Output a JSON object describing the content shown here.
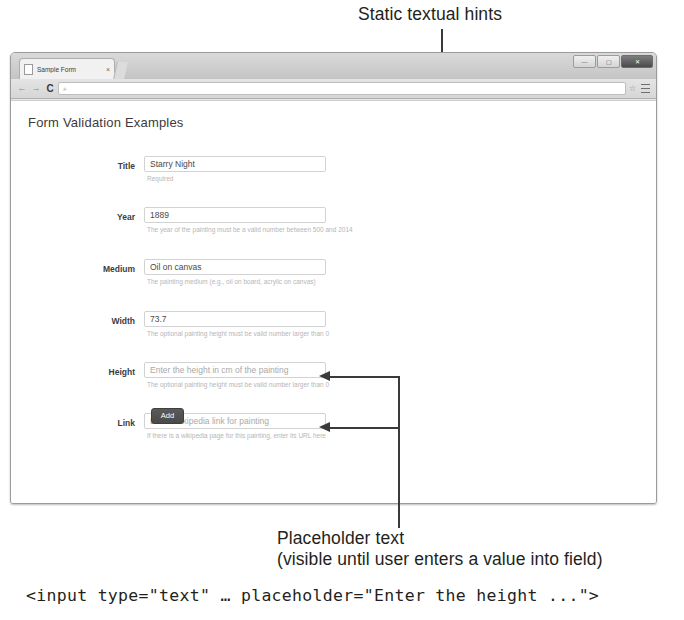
{
  "annotations": {
    "top_callout": "Static textual hints",
    "bottom_callout_line1": "Placeholder text",
    "bottom_callout_line2": "(visible until user enters a value into field)",
    "code_snippet": "<input type=\"text\" … placeholder=\"Enter the height ...\">"
  },
  "browser": {
    "tab": {
      "title": "Sample Form",
      "close_label": "×",
      "favicon_name": "page-icon"
    },
    "window_controls": {
      "minimize": "—",
      "maximize": "▢",
      "close": "✕"
    },
    "toolbar": {
      "back": "←",
      "forward": "→",
      "reload": "C",
      "omnibox_value": "",
      "omnibox_placeholder": "",
      "search_icon": "⌕",
      "bookmark_star": "☆",
      "menu_icon": "menu-icon"
    }
  },
  "page": {
    "heading": "Form Validation Examples",
    "fields": [
      {
        "label": "Title",
        "value": "Starry Night",
        "placeholder": "",
        "hint": "Required",
        "name": "title"
      },
      {
        "label": "Year",
        "value": "1889",
        "placeholder": "",
        "hint": "The year of the painting must be a valid number between 500 and 2014",
        "name": "year"
      },
      {
        "label": "Medium",
        "value": "Oil on canvas",
        "placeholder": "",
        "hint": "The painting medium (e.g., oil on board, acrylic on canvas)",
        "name": "medium"
      },
      {
        "label": "Width",
        "value": "73.7",
        "placeholder": "",
        "hint": "The optional painting height must be valid number larger than 0",
        "name": "width"
      },
      {
        "label": "Height",
        "value": "",
        "placeholder": "Enter the height in cm of the painting",
        "hint": "The optional painting height must be valid number larger than 0",
        "name": "height"
      },
      {
        "label": "Link",
        "value": "",
        "placeholder": "Enter Wikipedia link for painting",
        "hint": "If there is a wikipedia page for this painting, enter its URL here",
        "name": "link"
      }
    ],
    "submit_button": "Add"
  },
  "colors": {
    "page_background": "#ffffff",
    "annotation_text": "#231f20",
    "hint_text": "#b6b6b6",
    "button_background": "#4a4a4a",
    "leader_line": "#3a3a3a"
  }
}
